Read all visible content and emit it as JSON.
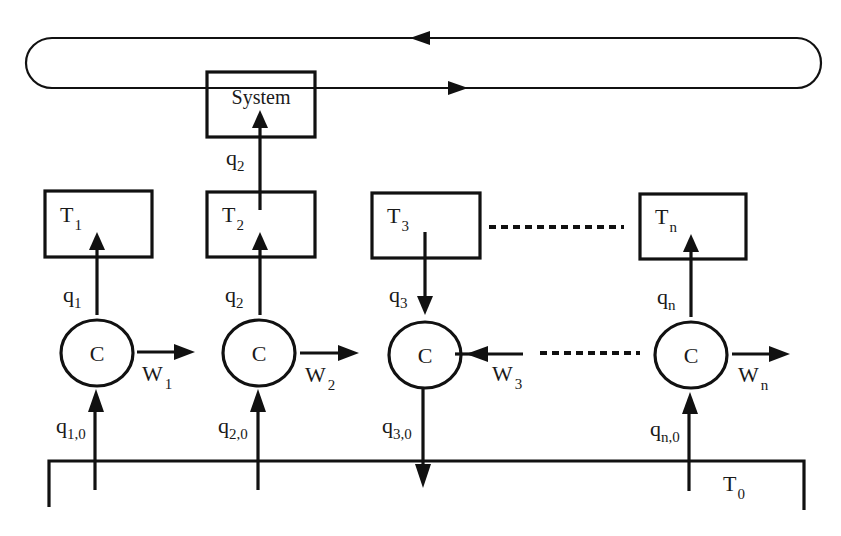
{
  "diagram": {
    "type": "flow-diagram",
    "system": {
      "label": "System"
    },
    "loop": {
      "top_arrow_direction": "left",
      "bottom_arrow_direction": "right"
    },
    "tanks": [
      {
        "main": "T",
        "sub": "1"
      },
      {
        "main": "T",
        "sub": "2"
      },
      {
        "main": "T",
        "sub": "3"
      },
      {
        "main": "T",
        "sub": "n"
      }
    ],
    "system_flow": {
      "main": "q",
      "sub": "2"
    },
    "tank_flows": [
      {
        "main": "q",
        "sub": "1",
        "direction": "up"
      },
      {
        "main": "q",
        "sub": "2",
        "direction": "up"
      },
      {
        "main": "q",
        "sub": "3",
        "direction": "down"
      },
      {
        "main": "q",
        "sub": "n",
        "direction": "up"
      }
    ],
    "compressors": [
      {
        "label": "C"
      },
      {
        "label": "C"
      },
      {
        "label": "C"
      },
      {
        "label": "C"
      }
    ],
    "work": [
      {
        "main": "W",
        "sub": "1",
        "direction": "out"
      },
      {
        "main": "W",
        "sub": "2",
        "direction": "out"
      },
      {
        "main": "W",
        "sub": "3",
        "direction": "in"
      },
      {
        "main": "W",
        "sub": "n",
        "direction": "out"
      }
    ],
    "reservoir_flows": [
      {
        "main": "q",
        "sub": "1,0",
        "direction": "up"
      },
      {
        "main": "q",
        "sub": "2,0",
        "direction": "up"
      },
      {
        "main": "q",
        "sub": "3,0",
        "direction": "down"
      },
      {
        "main": "q",
        "sub": "n,0",
        "direction": "up"
      }
    ],
    "reservoir": {
      "main": "T",
      "sub": "0"
    }
  }
}
